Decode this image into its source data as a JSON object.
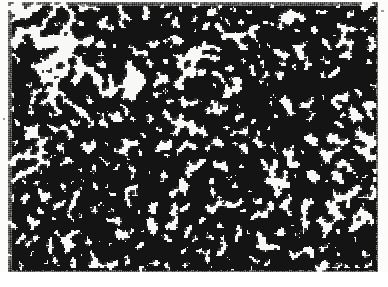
{
  "figure": {
    "kind": "percolation-cluster",
    "width": 388,
    "height": 287
  },
  "canvas": {
    "background_color": "#f8f8f6",
    "ink_color": "#141414",
    "ink_color_soft": "#3a3a3a",
    "paper_tint": "#fcfcfa"
  },
  "plot_area": {
    "left": 8,
    "top": 2,
    "right": 378,
    "bottom": 272,
    "width": 370,
    "height": 270
  },
  "pattern_params": {
    "seed": 20240517,
    "lattice_cell_px": 2,
    "occupation_probability": 0.595,
    "smoothing_passes": 2,
    "smoothing_birth_threshold": 5,
    "smoothing_survive_threshold": 4,
    "speckle_probability": 0.16,
    "edge_fade_px": 3,
    "blob_size_px": 3,
    "ink_coverage_estimate": 0.47
  },
  "density_field": {
    "note": "Large-scale modulation of occupation probability; voids are low-density lobes",
    "base": 0.575,
    "amplitude": 0.175,
    "lobes": [
      {
        "name": "void-top-left",
        "cx": 42,
        "cy": 34,
        "rx": 74,
        "ry": 56,
        "weight": -0.86
      },
      {
        "name": "void-upper-mid",
        "cx": 126,
        "cy": 86,
        "rx": 34,
        "ry": 30,
        "weight": -0.58
      },
      {
        "name": "void-left-mid",
        "cx": 36,
        "cy": 150,
        "rx": 36,
        "ry": 30,
        "weight": -0.52
      },
      {
        "name": "void-center",
        "cx": 196,
        "cy": 132,
        "rx": 26,
        "ry": 22,
        "weight": -0.4
      },
      {
        "name": "void-right-upper",
        "cx": 318,
        "cy": 52,
        "rx": 30,
        "ry": 24,
        "weight": -0.34
      },
      {
        "name": "void-right-mid",
        "cx": 286,
        "cy": 160,
        "rx": 34,
        "ry": 28,
        "weight": -0.46
      },
      {
        "name": "void-bottom-right",
        "cx": 342,
        "cy": 218,
        "rx": 48,
        "ry": 38,
        "weight": -0.72
      },
      {
        "name": "void-lower-left",
        "cx": 30,
        "cy": 232,
        "rx": 26,
        "ry": 26,
        "weight": -0.44
      },
      {
        "name": "void-lower-mid",
        "cx": 150,
        "cy": 222,
        "rx": 24,
        "ry": 20,
        "weight": -0.3
      },
      {
        "name": "dense-upper-right",
        "cx": 300,
        "cy": 100,
        "rx": 86,
        "ry": 62,
        "weight": 0.3
      },
      {
        "name": "dense-center-left",
        "cx": 112,
        "cy": 178,
        "rx": 76,
        "ry": 62,
        "weight": 0.32
      },
      {
        "name": "dense-bottom-band",
        "cx": 170,
        "cy": 262,
        "rx": 150,
        "ry": 32,
        "weight": 0.34
      },
      {
        "name": "dense-mid-spine",
        "cx": 214,
        "cy": 196,
        "rx": 70,
        "ry": 48,
        "weight": 0.26
      },
      {
        "name": "dense-top-spur",
        "cx": 150,
        "cy": 28,
        "rx": 36,
        "ry": 26,
        "weight": 0.2
      }
    ]
  },
  "scan_artifacts": {
    "band_top": 272,
    "band_height": 15,
    "band_color": "#ffffff",
    "smudge_opacity": 0.3,
    "caption_top": 275,
    "caption_left": 10,
    "caption_text": "",
    "flecks": [
      {
        "x": 14,
        "y": 186,
        "w": 2,
        "h": 3
      },
      {
        "x": 9,
        "y": 199,
        "w": 2,
        "h": 2
      },
      {
        "x": 381,
        "y": 10,
        "w": 3,
        "h": 2
      },
      {
        "x": 376,
        "y": 131,
        "w": 2,
        "h": 2
      },
      {
        "x": 3,
        "y": 118,
        "w": 2,
        "h": 2
      },
      {
        "x": 364,
        "y": 256,
        "w": 2,
        "h": 2
      }
    ]
  }
}
